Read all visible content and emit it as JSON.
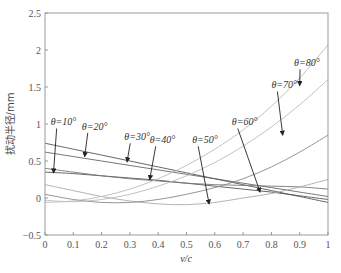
{
  "chart_data": {
    "type": "line",
    "title": "",
    "xlabel": "v/c",
    "ylabel": "扰动半径/mm",
    "xlim": [
      0,
      1
    ],
    "ylim": [
      -0.5,
      2.5
    ],
    "xticks": [
      "0",
      "0.1",
      "0.2",
      "0.3",
      "0.4",
      "0.5",
      "0.6",
      "0.7",
      "0.8",
      "0.9",
      "1"
    ],
    "yticks": [
      "−0.5",
      "0",
      "0.5",
      "1",
      "1.5",
      "2",
      "2.5"
    ],
    "grid": false,
    "legend": "annotations with arrows",
    "x": [
      0,
      0.1,
      0.2,
      0.3,
      0.4,
      0.5,
      0.6,
      0.7,
      0.8,
      0.9,
      1.0
    ],
    "series": [
      {
        "name": "θ=10°",
        "values": [
          0.35,
          0.33,
          0.3,
          0.27,
          0.24,
          0.2,
          0.16,
          0.12,
          0.08,
          0.03,
          -0.02
        ],
        "color": "#555"
      },
      {
        "name": "θ=20°",
        "values": [
          0.62,
          0.56,
          0.5,
          0.44,
          0.38,
          0.32,
          0.26,
          0.2,
          0.14,
          0.08,
          0.02
        ],
        "color": "#666"
      },
      {
        "name": "θ=30°",
        "values": [
          0.74,
          0.66,
          0.58,
          0.5,
          0.42,
          0.34,
          0.26,
          0.18,
          0.1,
          0.02,
          -0.06
        ],
        "color": "#555"
      },
      {
        "name": "θ=40°",
        "values": [
          0.4,
          0.35,
          0.3,
          0.26,
          0.23,
          0.2,
          0.18,
          0.17,
          0.16,
          0.15,
          0.12
        ],
        "color": "#777"
      },
      {
        "name": "θ=50°",
        "values": [
          0.18,
          0.1,
          0.02,
          -0.04,
          -0.08,
          -0.09,
          -0.06,
          0.0,
          0.06,
          0.15,
          0.25
        ],
        "color": "#aaa"
      },
      {
        "name": "θ=60°",
        "values": [
          0.05,
          -0.02,
          -0.06,
          -0.06,
          -0.02,
          0.05,
          0.14,
          0.26,
          0.42,
          0.62,
          0.85
        ],
        "color": "#888"
      },
      {
        "name": "θ=70°",
        "values": [
          -0.03,
          -0.05,
          -0.02,
          0.05,
          0.16,
          0.3,
          0.48,
          0.7,
          0.96,
          1.26,
          1.6
        ],
        "color": "#bbb"
      },
      {
        "name": "θ=80°",
        "values": [
          -0.06,
          -0.04,
          0.02,
          0.12,
          0.26,
          0.44,
          0.66,
          0.92,
          1.24,
          1.62,
          2.07
        ],
        "color": "#bbb"
      }
    ],
    "annotations": [
      {
        "text": "θ=10°",
        "label_x": 0.02,
        "label_y": 0.98,
        "arrow_to_x": 0.03,
        "arrow_to_y": 0.34
      },
      {
        "text": "θ=20°",
        "label_x": 0.13,
        "label_y": 0.92,
        "arrow_to_x": 0.14,
        "arrow_to_y": 0.56
      },
      {
        "text": "θ=30°",
        "label_x": 0.28,
        "label_y": 0.78,
        "arrow_to_x": 0.29,
        "arrow_to_y": 0.49
      },
      {
        "text": "θ=40°",
        "label_x": 0.37,
        "label_y": 0.74,
        "arrow_to_x": 0.37,
        "arrow_to_y": 0.25
      },
      {
        "text": "θ=50°",
        "label_x": 0.52,
        "label_y": 0.74,
        "arrow_to_x": 0.58,
        "arrow_to_y": -0.08
      },
      {
        "text": "θ=60°",
        "label_x": 0.66,
        "label_y": 0.98,
        "arrow_to_x": 0.76,
        "arrow_to_y": 0.08
      },
      {
        "text": "θ=70°",
        "label_x": 0.8,
        "label_y": 1.48,
        "arrow_to_x": 0.84,
        "arrow_to_y": 0.85
      },
      {
        "text": "θ=80°",
        "label_x": 0.88,
        "label_y": 1.78,
        "arrow_to_x": 0.9,
        "arrow_to_y": 1.52
      }
    ]
  }
}
